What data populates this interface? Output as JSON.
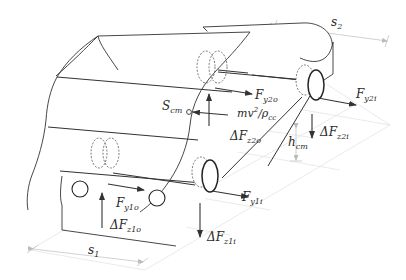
{
  "diagram": {
    "colors": {
      "outline": "#333333",
      "force_arrow": "#333333",
      "ground_grid": "#d4d4d4",
      "dimension": "#bdbdbd",
      "text": "#2a2a2a"
    },
    "labels": {
      "s2": {
        "main": "s",
        "sub": "2"
      },
      "s1": {
        "main": "s",
        "sub": "1"
      },
      "F_y2o": {
        "main": "F",
        "sub": "y2o"
      },
      "F_y2i": {
        "main": "F",
        "sub": "y2i"
      },
      "S_cm": {
        "main": "S",
        "sub": "cm"
      },
      "centrifugal": {
        "main": "mv",
        "sup": "2",
        "slash": "/",
        "rho": "ρ",
        "sub": "cc"
      },
      "dF_z2o": {
        "main": "ΔF",
        "sub": "z2o"
      },
      "dF_z2i": {
        "main": "ΔF",
        "sub": "z2i"
      },
      "h_cm": {
        "main": "h",
        "sub": "cm"
      },
      "F_y1o": {
        "main": "F",
        "sub": "y1o"
      },
      "F_y1i": {
        "main": "F",
        "sub": "y1i"
      },
      "dF_z1o": {
        "main": "ΔF",
        "sub": "z1o"
      },
      "dF_z1i": {
        "main": "ΔF",
        "sub": "z1i"
      }
    }
  }
}
